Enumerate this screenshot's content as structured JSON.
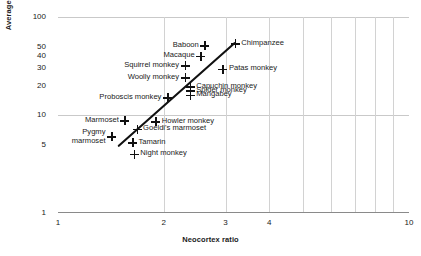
{
  "chart_data": {
    "type": "scatter",
    "title": "",
    "xlabel": "Neocortex ratio",
    "ylabel": "Average group size",
    "xscale": "log",
    "yscale": "log",
    "xlim": [
      1,
      10
    ],
    "ylim": [
      1,
      100
    ],
    "xticks": [
      "1",
      "2",
      "3",
      "4",
      "10"
    ],
    "xtick_values": [
      1,
      2,
      3,
      4,
      10
    ],
    "yticks": [
      "1",
      "5",
      "10",
      "20",
      "30",
      "40",
      "50",
      "100"
    ],
    "ytick_values": [
      1,
      5,
      10,
      20,
      30,
      40,
      50,
      100
    ],
    "grid": "both",
    "legend": "none",
    "points": [
      {
        "label": "Chimpanzee",
        "x": 3.2,
        "y": 53.5,
        "label_pos": "right"
      },
      {
        "label": "Baboon",
        "x": 2.62,
        "y": 51.0,
        "label_pos": "left"
      },
      {
        "label": "Macaque",
        "x": 2.55,
        "y": 40.0,
        "label_pos": "left"
      },
      {
        "label": "Squirrel monkey",
        "x": 2.3,
        "y": 32.0,
        "label_pos": "left"
      },
      {
        "label": "Patas monkey",
        "x": 2.95,
        "y": 29.5,
        "label_pos": "right"
      },
      {
        "label": "Woolly monkey",
        "x": 2.3,
        "y": 24.0,
        "label_pos": "left"
      },
      {
        "label": "Capuchin monkey",
        "x": 2.38,
        "y": 19.5,
        "label_pos": "right"
      },
      {
        "label": "Spider monkey",
        "x": 2.38,
        "y": 17.8,
        "label_pos": "right"
      },
      {
        "label": "Mangabey",
        "x": 2.38,
        "y": 16.0,
        "label_pos": "right"
      },
      {
        "label": "Proboscis monkey",
        "x": 2.05,
        "y": 15.0,
        "label_pos": "left"
      },
      {
        "label": "Marmoset",
        "x": 1.55,
        "y": 8.8,
        "label_pos": "left"
      },
      {
        "label": "Howler monkey",
        "x": 1.9,
        "y": 8.6,
        "label_pos": "right"
      },
      {
        "label": "Goeldi's marmoset",
        "x": 1.68,
        "y": 7.2,
        "label_pos": "right"
      },
      {
        "label": "Pygmy marmoset",
        "x": 1.42,
        "y": 6.0,
        "label_pos": "left"
      },
      {
        "label": "Tamarin",
        "x": 1.63,
        "y": 5.2,
        "label_pos": "right"
      },
      {
        "label": "Night monkey",
        "x": 1.65,
        "y": 4.0,
        "label_pos": "right"
      }
    ],
    "trendline": {
      "x_start": 1.49,
      "y_start": 4.85,
      "x_end": 3.18,
      "y_end": 54.0
    }
  }
}
